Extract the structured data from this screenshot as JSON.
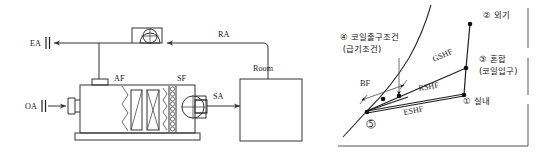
{
  "figure": {
    "left_diagram": {
      "title": "air-handling-unit-schematic",
      "labels": {
        "exhaust_air": "EA",
        "return_air": "RA",
        "outdoor_air": "OA",
        "supply_air": "SA",
        "air_filter": "AF",
        "supply_fan": "SF",
        "room": "Room"
      },
      "components": [
        {
          "name": "return-fan",
          "icon": "fan-icon"
        },
        {
          "name": "supply-fan",
          "icon": "fan-icon"
        },
        {
          "name": "air-filter",
          "icon": "filter-icon"
        },
        {
          "name": "cooling-coil",
          "icon": "coil-icon"
        },
        {
          "name": "room-box",
          "icon": "room-icon"
        }
      ]
    },
    "right_diagram": {
      "title": "psychrometric-chart",
      "process_labels": {
        "gshf": "GSHF",
        "rshf": "RSHF",
        "eshf": "ESHF",
        "bypass_factor": "BF"
      },
      "state_points": [
        {
          "id": "1",
          "marker": "①",
          "label": "실내"
        },
        {
          "id": "2",
          "marker": "②",
          "label": "외기"
        },
        {
          "id": "3",
          "marker": "③",
          "label": "혼합",
          "sub": "(코일입구)"
        },
        {
          "id": "4",
          "marker": "④",
          "label": "코일출구조건",
          "sub": "(급기조건)"
        },
        {
          "id": "5",
          "marker": "⑤",
          "label": ""
        }
      ]
    }
  },
  "colors": {
    "line": "#333333",
    "point": "#111111",
    "text": "#1a1a1a",
    "background": "#ffffff"
  }
}
